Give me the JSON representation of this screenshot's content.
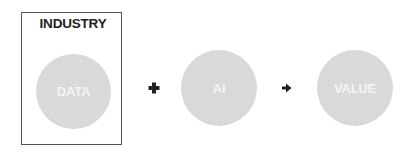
{
  "diagram": {
    "container": {
      "label": "INDUSTRY"
    },
    "nodes": [
      {
        "id": "data",
        "label": "DATA"
      },
      {
        "id": "ai",
        "label": "AI"
      },
      {
        "id": "value",
        "label": "VALUE"
      }
    ],
    "operators": [
      {
        "between": [
          "data",
          "ai"
        ],
        "symbol": "plus-icon"
      },
      {
        "between": [
          "ai",
          "value"
        ],
        "symbol": "arrow-right-icon"
      }
    ],
    "colors": {
      "circle_fill": "#d9d9d9",
      "circle_text": "#f4f4f4",
      "border": "#555555",
      "title_text": "#222222",
      "operator": "#222222"
    }
  }
}
